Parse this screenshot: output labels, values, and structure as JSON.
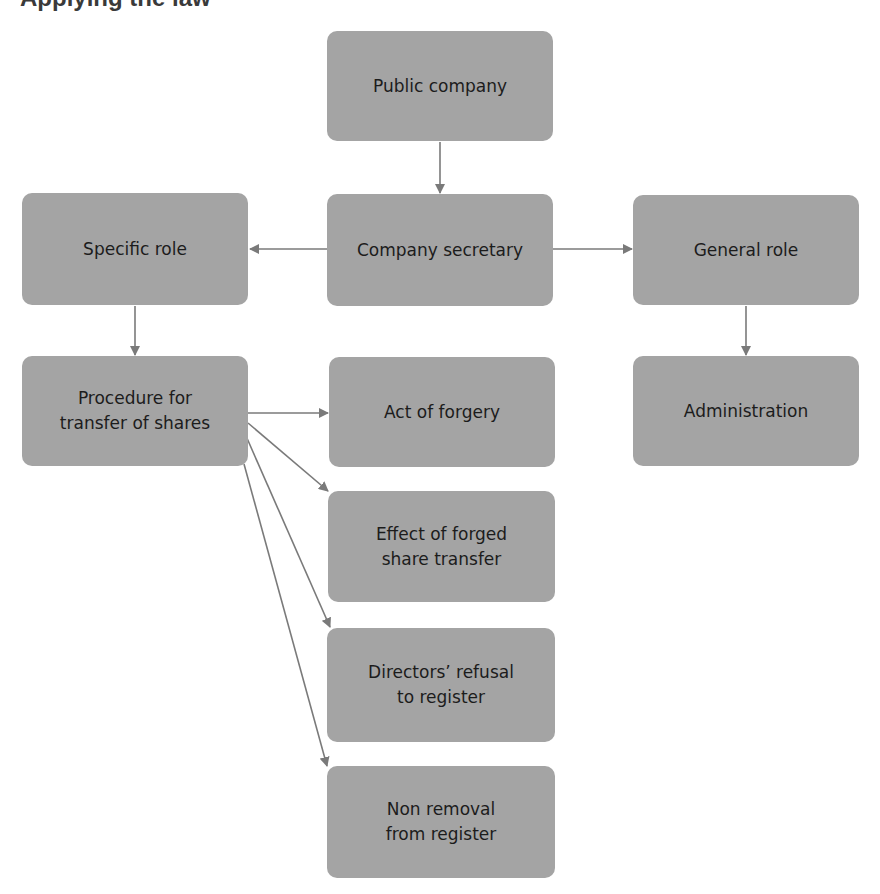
{
  "header": {
    "fragment": "Applying the law"
  },
  "diagram": {
    "box_color": "#a4a4a4",
    "text_color": "#1c1c1c",
    "edge_color": "#7a7a7a",
    "nodes": {
      "public_company": {
        "label": "Public company"
      },
      "company_secretary": {
        "label": "Company secretary"
      },
      "specific_role": {
        "label": "Specific role"
      },
      "general_role": {
        "label": "General role"
      },
      "procedure": {
        "label": "Procedure for\ntransfer of shares"
      },
      "act_of_forgery": {
        "label": "Act of forgery"
      },
      "administration": {
        "label": "Administration"
      },
      "effect_forged": {
        "label": "Effect of forged\nshare transfer"
      },
      "directors_refusal": {
        "label": "Directors’ refusal\nto register"
      },
      "non_removal": {
        "label": "Non removal\nfrom register"
      }
    },
    "edges": [
      {
        "from": "Public company",
        "to": "Company secretary"
      },
      {
        "from": "Company secretary",
        "to": "Specific role"
      },
      {
        "from": "Company secretary",
        "to": "General role"
      },
      {
        "from": "Specific role",
        "to": "Procedure for transfer of shares"
      },
      {
        "from": "General role",
        "to": "Administration"
      },
      {
        "from": "Procedure for transfer of shares",
        "to": "Act of forgery"
      },
      {
        "from": "Procedure for transfer of shares",
        "to": "Effect of forged share transfer"
      },
      {
        "from": "Procedure for transfer of shares",
        "to": "Directors’ refusal to register"
      },
      {
        "from": "Procedure for transfer of shares",
        "to": "Non removal from register"
      }
    ]
  }
}
